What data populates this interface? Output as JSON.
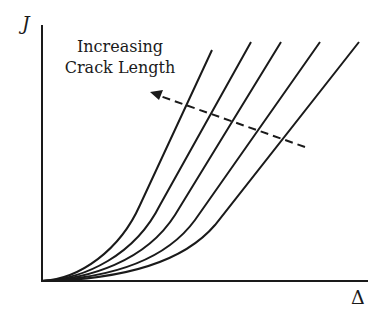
{
  "diagram": {
    "y_axis_label": "J",
    "x_axis_label": "Δ",
    "annotation": {
      "line1": "Increasing",
      "line2": "Crack Length"
    },
    "curves_count": 5,
    "curves": [
      {
        "top": [
          212,
          50
        ]
      },
      {
        "top": [
          251,
          42
        ]
      },
      {
        "top": [
          281,
          42
        ]
      },
      {
        "top": [
          320,
          42
        ]
      },
      {
        "top": [
          359,
          42
        ]
      }
    ],
    "arrow": {
      "from": [
        305,
        147
      ],
      "to": [
        152,
        93
      ],
      "style": "dashed"
    },
    "colors": {
      "ink": "#1a1a1a",
      "background": "#ffffff"
    }
  }
}
